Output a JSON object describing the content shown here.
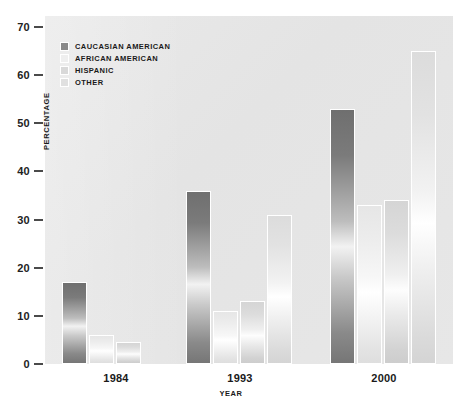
{
  "chart_data": {
    "type": "bar",
    "title": "",
    "xlabel": "YEAR",
    "ylabel": "PERCENTAGE",
    "categories": [
      "1984",
      "1993",
      "2000"
    ],
    "ylim": [
      0,
      70
    ],
    "yticks": [
      0,
      10,
      20,
      30,
      40,
      50,
      60,
      70
    ],
    "grid": false,
    "legend_position": "top-left",
    "series": [
      {
        "name": "CAUCASIAN AMERICAN",
        "color": "#8a8a8a",
        "values": [
          17,
          36,
          53
        ]
      },
      {
        "name": "AFRICAN AMERICAN",
        "color": "#efefef",
        "values": [
          6,
          11,
          33
        ]
      },
      {
        "name": "HISPANIC",
        "color": "#d9d9d9",
        "values": [
          4.5,
          13,
          34
        ]
      },
      {
        "name": "OTHER",
        "color": "#e0e0e0",
        "values": [
          0,
          31,
          65
        ]
      }
    ]
  },
  "axes": {
    "y_title": "PERCENTAGE",
    "x_title": "YEAR",
    "y_ticks": [
      "70",
      "60",
      "50",
      "40",
      "30",
      "20",
      "10",
      "0"
    ],
    "x_ticks": [
      "1984",
      "1993",
      "2000"
    ]
  },
  "legend": {
    "items": [
      {
        "label": "CAUCASIAN AMERICAN"
      },
      {
        "label": "AFRICAN AMERICAN"
      },
      {
        "label": "HISPANIC"
      },
      {
        "label": "OTHER"
      }
    ]
  }
}
